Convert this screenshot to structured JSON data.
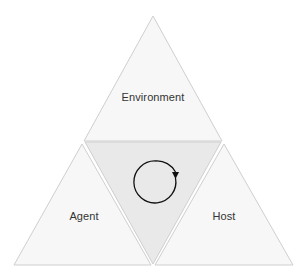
{
  "diagram": {
    "type": "triangle-partition",
    "regions": {
      "top": {
        "label": "Environment"
      },
      "left": {
        "label": "Agent"
      },
      "right": {
        "label": "Host"
      },
      "center": {
        "icon": "clockwise-cycle-arrow-icon"
      }
    },
    "colors": {
      "background": "#ffffff",
      "outer_fill": "#f7f7f7",
      "center_fill": "#e9e9e9",
      "edge": "#cfcfcf",
      "arrow": "#111111",
      "text": "#333333"
    }
  }
}
